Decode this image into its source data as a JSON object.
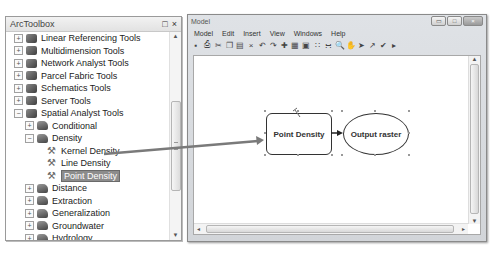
{
  "toolbox": {
    "title": "ArcToolbox",
    "controls": {
      "maximize": "□",
      "close": "×"
    },
    "items": [
      {
        "label": "Linear Referencing Tools",
        "level": 0,
        "expander": "+",
        "icon": "toolbox-icon"
      },
      {
        "label": "Multidimension Tools",
        "level": 0,
        "expander": "+",
        "icon": "toolbox-icon"
      },
      {
        "label": "Network Analyst Tools",
        "level": 0,
        "expander": "+",
        "icon": "toolbox-icon"
      },
      {
        "label": "Parcel Fabric Tools",
        "level": 0,
        "expander": "+",
        "icon": "toolbox-icon"
      },
      {
        "label": "Schematics Tools",
        "level": 0,
        "expander": "+",
        "icon": "toolbox-icon"
      },
      {
        "label": "Server Tools",
        "level": 0,
        "expander": "+",
        "icon": "toolbox-icon"
      },
      {
        "label": "Spatial Analyst Tools",
        "level": 0,
        "expander": "−",
        "icon": "toolbox-icon"
      },
      {
        "label": "Conditional",
        "level": 1,
        "expander": "+",
        "icon": "toolset-icon"
      },
      {
        "label": "Density",
        "level": 1,
        "expander": "−",
        "icon": "toolset-icon"
      },
      {
        "label": "Kernel Density",
        "level": 2,
        "expander": "",
        "icon": "tool-hammer-icon"
      },
      {
        "label": "Line Density",
        "level": 2,
        "expander": "",
        "icon": "tool-hammer-icon"
      },
      {
        "label": "Point Density",
        "level": 2,
        "expander": "",
        "icon": "tool-hammer-icon",
        "selected": true
      },
      {
        "label": "Distance",
        "level": 1,
        "expander": "+",
        "icon": "toolset-icon"
      },
      {
        "label": "Extraction",
        "level": 1,
        "expander": "+",
        "icon": "toolset-icon"
      },
      {
        "label": "Generalization",
        "level": 1,
        "expander": "+",
        "icon": "toolset-icon"
      },
      {
        "label": "Groundwater",
        "level": 1,
        "expander": "+",
        "icon": "toolset-icon"
      },
      {
        "label": "Hydrology",
        "level": 1,
        "expander": "+",
        "icon": "toolset-icon"
      },
      {
        "label": "Interpolation",
        "level": 1,
        "expander": "+",
        "icon": "toolset-icon"
      },
      {
        "label": "Local",
        "level": 1,
        "expander": "+",
        "icon": "toolset-icon"
      },
      {
        "label": "Map Algebra",
        "level": 1,
        "expander": "+",
        "icon": "toolset-icon",
        "clipped": true
      }
    ]
  },
  "model_window": {
    "title": "Model",
    "window_buttons": {
      "minimize": "▭",
      "maximize": "□",
      "close": "×"
    },
    "menu": [
      "Model",
      "Edit",
      "Insert",
      "View",
      "Windows",
      "Help"
    ],
    "toolbar_icons": [
      "save-icon",
      "print-icon",
      "cut-icon",
      "copy-icon",
      "paste-icon",
      "delete-icon",
      "undo-icon",
      "redo-icon",
      "add-data-icon",
      "auto-layout-icon",
      "full-extent-icon",
      "zoom-in-fixed-icon",
      "zoom-out-fixed-icon",
      "zoom-icon",
      "pan-icon",
      "select-icon",
      "connect-icon",
      "validate-icon",
      "run-icon"
    ],
    "toolbar_glyphs": [
      "▪",
      "⎙",
      "✂",
      "❐",
      "▤",
      "×",
      "↶",
      "↷",
      "✚",
      "▦",
      "▣",
      "∷",
      "∺",
      "🔍",
      "✋",
      "➤",
      "↗",
      "✔",
      "▸"
    ]
  },
  "diagram": {
    "process": {
      "label": "Point Density"
    },
    "output": {
      "label": "Output raster"
    }
  },
  "colors": {
    "selection": "#8c8c8c",
    "drag_arrow": "#7a7a7a",
    "window_chrome": "#d6d9dd"
  }
}
